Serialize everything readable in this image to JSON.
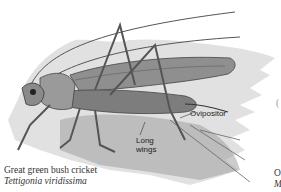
{
  "figure": {
    "labels": {
      "ovipositor": "Ovipositor",
      "long_wings_line1": "Long",
      "long_wings_line2": "wings"
    },
    "caption": {
      "common_name": "Great green bush cricket",
      "latin_name": "Tettigonia viridissima"
    },
    "cut_off_caption": {
      "line1": "O",
      "line2": "M"
    },
    "cut_off_paren": "("
  }
}
